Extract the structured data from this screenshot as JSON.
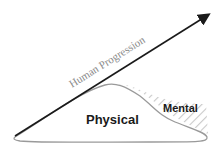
{
  "diagram": {
    "arrow": {
      "label": "Human Progression",
      "color": "#1a1a1a"
    },
    "regions": [
      {
        "id": "physical",
        "label": "Physical",
        "fill": "#ffffff",
        "stroke": "#9a9a9a"
      },
      {
        "id": "mental",
        "label": "Mental",
        "hatch_color": "#c8c8c8"
      }
    ]
  }
}
